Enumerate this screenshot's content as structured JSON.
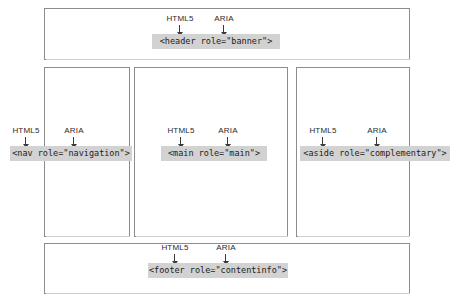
{
  "diagram": {
    "annotation_labels": {
      "html5": "HTML5",
      "aria": "ARIA"
    },
    "colors": {
      "label_background": "#d2d2d2",
      "box_border": "#8c8c8c",
      "arrow": "#3a3a3a",
      "page_background": "#ffffff",
      "text": "#1c1c1c"
    },
    "regions": [
      {
        "id": "header",
        "code": "<header role=\"banner\">",
        "html5_label": "HTML5",
        "aria_label": "ARIA"
      },
      {
        "id": "nav",
        "code": "<nav role=\"navigation\">",
        "html5_label": "HTML5",
        "aria_label": "ARIA"
      },
      {
        "id": "main",
        "code": "<main role=\"main\">",
        "html5_label": "HTML5",
        "aria_label": "ARIA"
      },
      {
        "id": "aside",
        "code": "<aside role=\"complementary\">",
        "html5_label": "HTML5",
        "aria_label": "ARIA"
      },
      {
        "id": "footer",
        "code": "<footer role=\"contentinfo\">",
        "html5_label": "HTML5",
        "aria_label": "ARIA"
      }
    ]
  }
}
